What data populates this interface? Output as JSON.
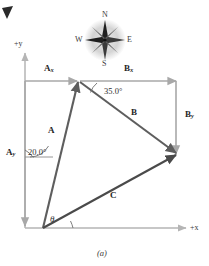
{
  "figure": {
    "caption": "(a)",
    "axes": {
      "y_label": "+y",
      "x_label": "+x"
    },
    "compass": {
      "north": "N",
      "south": "S",
      "east": "E",
      "west": "W"
    },
    "vectors": [
      {
        "name": "vector-a",
        "label": "A",
        "style": "bold-italic",
        "color": "#5e5e5e"
      },
      {
        "name": "vector-b",
        "label": "B",
        "style": "bold-italic",
        "color": "#5e5e5e"
      },
      {
        "name": "vector-c",
        "label": "C",
        "style": "bold-italic",
        "color": "#4a4a4a"
      }
    ],
    "components": [
      {
        "name": "component-ax",
        "base": "A",
        "sub": "x",
        "color": "#a8a8a8"
      },
      {
        "name": "component-ay",
        "base": "A",
        "sub": "y",
        "color": "#a8a8a8"
      },
      {
        "name": "component-bx",
        "base": "B",
        "sub": "x",
        "color": "#a8a8a8"
      },
      {
        "name": "component-by",
        "base": "B",
        "sub": "y",
        "color": "#a8a8a8"
      }
    ],
    "angles": [
      {
        "name": "angle-a",
        "value": "20.0°"
      },
      {
        "name": "angle-b",
        "value": "35.0°"
      },
      {
        "name": "angle-theta",
        "value": "θ"
      }
    ],
    "colors": {
      "axis": "#b5b5b5",
      "component": "#a8a8a8",
      "vector_a": "#5e5e5e",
      "vector_b": "#5e5e5e",
      "vector_c": "#4a4a4a",
      "text": "#2b2b2b",
      "compass_fill": "#cfcfcf",
      "corner_mark": "#2a2a2a"
    }
  }
}
